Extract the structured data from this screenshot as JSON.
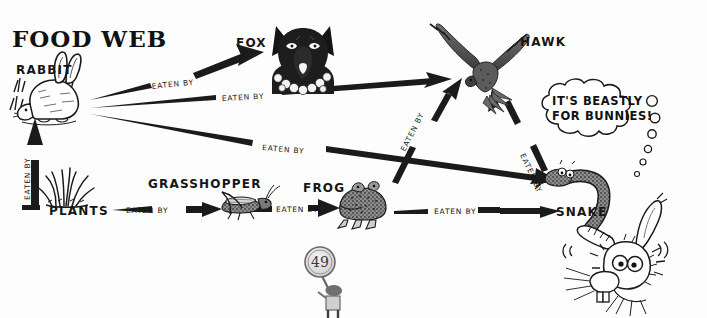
{
  "page": {
    "title": "FOOD WEB",
    "page_number": "49",
    "background_color": "#fdfdfd",
    "ink_color": "#1b1b1b",
    "width": 707,
    "height": 318
  },
  "nodes": [
    {
      "id": "rabbit",
      "label": "RABBIT",
      "icon": "rabbit-illustration",
      "x": 50,
      "y": 75
    },
    {
      "id": "fox",
      "label": "FOX",
      "icon": "fox-head-illustration",
      "x": 253,
      "y": 43
    },
    {
      "id": "hawk",
      "label": "HAWK",
      "icon": "hawk-illustration",
      "x": 540,
      "y": 42
    },
    {
      "id": "plants",
      "label": "PLANTS",
      "icon": "grass-illustration",
      "x": 84,
      "y": 210
    },
    {
      "id": "grasshopper",
      "label": "GRASSHOPPER",
      "icon": "grasshopper-illustration",
      "x": 196,
      "y": 185
    },
    {
      "id": "frog",
      "label": "FROG",
      "icon": "frog-illustration",
      "x": 325,
      "y": 189
    },
    {
      "id": "snake",
      "label": "SNAKE",
      "icon": "snake-illustration",
      "x": 575,
      "y": 210
    }
  ],
  "edges": [
    {
      "id": "rabbit-fox",
      "from": "RABBIT",
      "to": "FOX",
      "label": "EATEN BY"
    },
    {
      "id": "rabbit-hawk",
      "from": "RABBIT",
      "to": "HAWK",
      "label": "EATEN BY"
    },
    {
      "id": "rabbit-snake",
      "from": "RABBIT",
      "to": "SNAKE",
      "label": "EATEN BY"
    },
    {
      "id": "plants-rabbit",
      "from": "PLANTS",
      "to": "RABBIT",
      "label": "EATEN BY"
    },
    {
      "id": "plants-grasshopper",
      "from": "PLANTS",
      "to": "GRASSHOPPER",
      "label": "EATEN BY"
    },
    {
      "id": "grasshopper-frog",
      "from": "GRASSHOPPER",
      "to": "FROG",
      "label": "EATEN BY"
    },
    {
      "id": "frog-snake",
      "from": "FROG",
      "to": "SNAKE",
      "label": "EATEN BY"
    },
    {
      "id": "frog-hawk",
      "from": "FROG",
      "to": "HAWK",
      "label": "EATEN BY"
    },
    {
      "id": "snake-hawk",
      "from": "SNAKE",
      "to": "HAWK",
      "label": "EATEN BY"
    }
  ],
  "thought_bubble": {
    "line1": "IT'S BEASTLY",
    "line2": "FOR BUNNIES!",
    "speaker": "startled-bunny"
  },
  "edge_labels": {
    "rabbit_fox": "EATEN BY",
    "rabbit_hawk": "EATEN BY",
    "rabbit_snake": "EATEN BY",
    "plants_rabbit": "EATEN BY",
    "plants_grasshopper": "EATEN BY",
    "grasshopper_frog": "EATEN BY",
    "frog_snake": "EATEN BY",
    "frog_hawk": "EATEN BY",
    "snake_hawk": "EATEN BY"
  },
  "node_labels": {
    "rabbit": "RABBIT",
    "fox": "FOX",
    "hawk": "HAWK",
    "plants": "PLANTS",
    "grasshopper": "GRASSHOPPER",
    "frog": "FROG",
    "snake": "SNAKE"
  }
}
